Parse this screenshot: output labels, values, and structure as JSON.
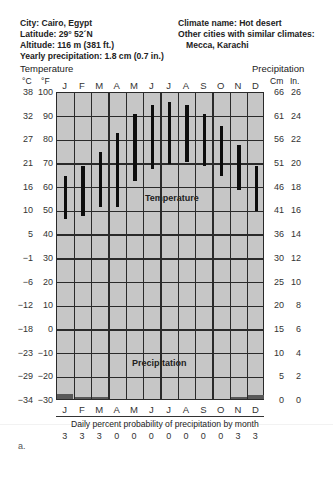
{
  "header": {
    "city": "City: Cairo, Egypt",
    "latitude": "Latitude: 29° 52´N",
    "altitude": "Altitude: 116 m (381 ft.)",
    "yearly_precip": "Yearly precipitation: 1.8 cm (0.7 in.)",
    "climate_name": "Climate name: Hot desert",
    "similar_label": "Other cities with similar climates:",
    "similar_cities": "Mecca, Karachi"
  },
  "axes": {
    "left_title": "Temperature",
    "left_unit_c": "°C",
    "left_unit_f": "°F",
    "right_title": "Precipitation",
    "right_unit_cm": "Cm",
    "right_unit_in": "In.",
    "celsius_ticks": [
      "38",
      "32",
      "27",
      "21",
      "16",
      "10",
      "5",
      "−1",
      "−6",
      "−12",
      "−18",
      "−23",
      "−29",
      "−34"
    ],
    "fahrenheit_ticks": [
      "100",
      "90",
      "80",
      "70",
      "60",
      "50",
      "40",
      "30",
      "20",
      "10",
      "0",
      "−10",
      "−20",
      "−30"
    ],
    "cm_ticks": [
      "66",
      "61",
      "56",
      "51",
      "46",
      "41",
      "36",
      "30",
      "25",
      "20",
      "15",
      "10",
      "5",
      "0"
    ],
    "in_ticks": [
      "26",
      "24",
      "22",
      "20",
      "18",
      "16",
      "14",
      "12",
      "10",
      "8",
      "6",
      "4",
      "2",
      "0"
    ]
  },
  "inner_labels": {
    "temperature": "Temperature",
    "precipitation": "Precipitation"
  },
  "footer": {
    "probability_title": "Daily percent probability of precipitation by month",
    "figure_label": "a."
  },
  "chart_data": {
    "type": "bar",
    "categories": [
      "J",
      "F",
      "M",
      "A",
      "M",
      "J",
      "J",
      "A",
      "S",
      "O",
      "N",
      "D"
    ],
    "series": [
      {
        "name": "Temperature range low (°F)",
        "values": [
          47,
          48,
          52,
          52,
          63,
          68,
          70,
          71,
          69,
          65,
          59,
          50
        ]
      },
      {
        "name": "Temperature range high (°F)",
        "values": [
          65,
          69,
          75,
          83,
          91,
          95,
          96,
          95,
          91,
          86,
          78,
          69
        ]
      },
      {
        "name": "Precipitation (cm)",
        "values": [
          1.0,
          0.5,
          0.4,
          0,
          0,
          0,
          0,
          0,
          0,
          0,
          0.5,
          0.9
        ]
      },
      {
        "name": "Daily percent probability of precipitation",
        "values": [
          3,
          3,
          3,
          0,
          0,
          0,
          0,
          0,
          0,
          0,
          3,
          3
        ]
      }
    ],
    "xlabel": "Month",
    "ylabel_left": "Temperature (°C / °F)",
    "ylabel_right": "Precipitation (Cm / In.)",
    "ylim_f": [
      -30,
      100
    ],
    "ylim_cm": [
      0,
      66
    ],
    "grid": true
  }
}
